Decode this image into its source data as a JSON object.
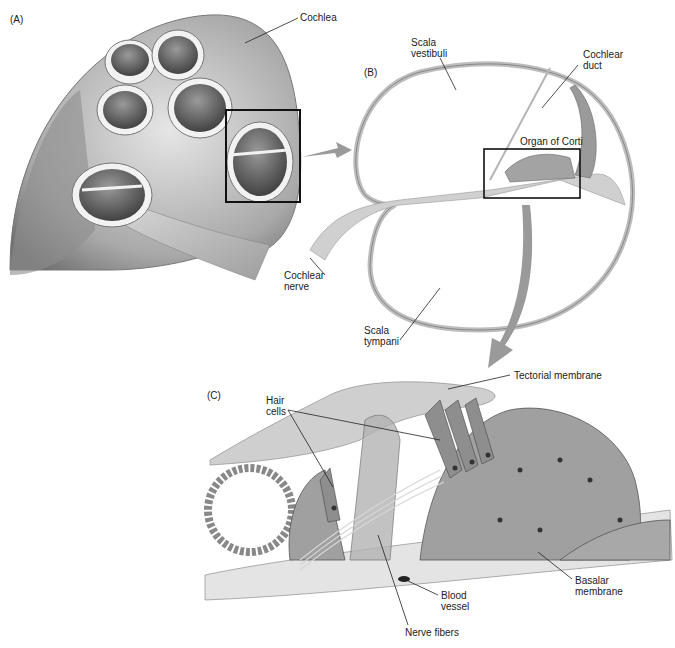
{
  "figure": {
    "panels": [
      {
        "id": "A",
        "label": "(A)"
      },
      {
        "id": "B",
        "label": "(B)"
      },
      {
        "id": "C",
        "label": "(C)"
      }
    ],
    "labels": {
      "cochlea": "Cochlea",
      "cochlear_nerve": "Cochlear\nnerve",
      "scala_vestibuli": "Scala\nvestibuli",
      "cochlear_duct": "Cochlear\nduct",
      "organ_of_corti": "Organ of Corti",
      "scala_tympani": "Scala\ntympani",
      "tectorial_membrane": "Tectorial membrane",
      "hair_cells": "Hair\ncells",
      "blood_vessel": "Blood\nvessel",
      "basalar_membrane": "Basalar\nmembrane",
      "nerve_fibers": "Nerve fibers"
    },
    "colors": {
      "tissue_gray": "#8a8a8a",
      "light_gray": "#c8c8c8",
      "arrow_gray": "#9a9a9a",
      "outline": "#1a1a1a"
    }
  }
}
